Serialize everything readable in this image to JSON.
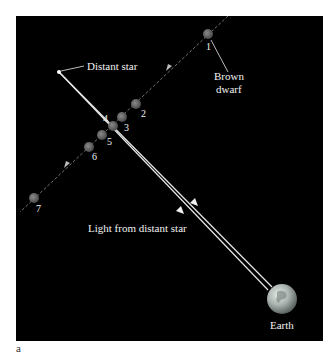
{
  "figure": {
    "caption_letter": "a",
    "background_color": "#000000",
    "labels": {
      "distant_star": "Distant star",
      "brown_dwarf_line1": "Brown",
      "brown_dwarf_line2": "dwarf",
      "light": "Light from distant star",
      "earth": "Earth"
    },
    "brown_dwarf_positions": [
      {
        "n": "1",
        "x": 208,
        "y": 34
      },
      {
        "n": "2",
        "x": 136,
        "y": 104
      },
      {
        "n": "3",
        "x": 122,
        "y": 117
      },
      {
        "n": "4",
        "x": 113,
        "y": 126
      },
      {
        "n": "5",
        "x": 102,
        "y": 135
      },
      {
        "n": "6",
        "x": 89,
        "y": 147
      },
      {
        "n": "7",
        "x": 34,
        "y": 198
      }
    ],
    "colors": {
      "brown_dwarf": "#6e6e6e",
      "line": "#e8e8e8",
      "earth": "#9aa3a0"
    }
  }
}
